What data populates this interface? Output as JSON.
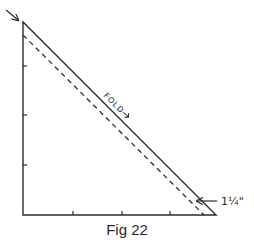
{
  "figure": {
    "caption": "Fig 22",
    "fold_label": "FOLD",
    "measurement_label": "1¼\"",
    "colors": {
      "line": "#2b2b2b",
      "background": "#ffffff"
    },
    "triangle": {
      "apex": [
        23,
        22
      ],
      "corner": [
        23,
        215
      ],
      "base_end": [
        216,
        215
      ]
    },
    "dashed_line": {
      "from": [
        23,
        35
      ],
      "to": [
        204,
        215
      ]
    },
    "left_ticks_y": [
      66,
      115,
      165
    ],
    "bottom_ticks_x": [
      73,
      122,
      170
    ],
    "pointer_arrow": {
      "from": [
        6,
        10
      ],
      "to": [
        18,
        19
      ]
    },
    "measurement_arrow": {
      "from": [
        217,
        201
      ],
      "to": [
        196,
        201
      ]
    }
  }
}
